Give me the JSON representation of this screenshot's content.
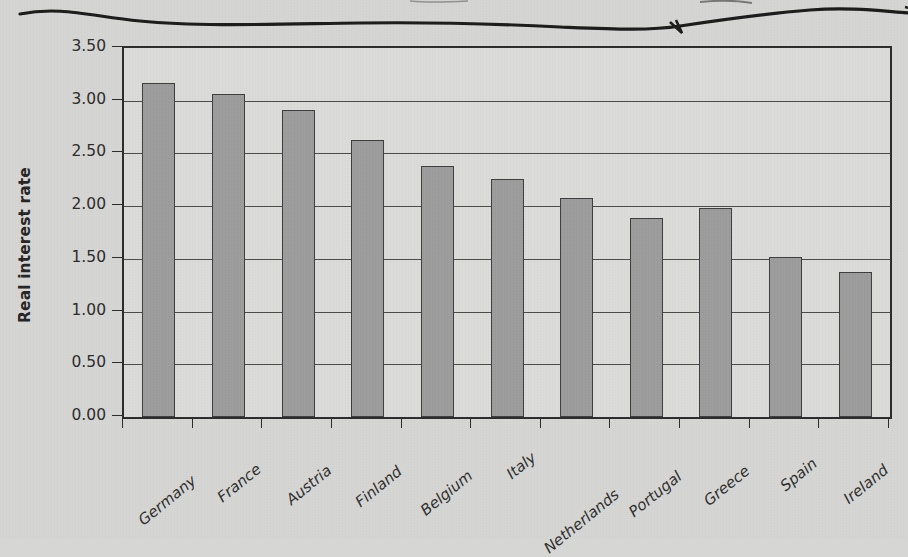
{
  "figure": {
    "annotation_note": "hand-drawn underline squiggle across top of scanned page (text above cropped off)"
  },
  "chart_data": {
    "type": "bar",
    "title": "",
    "subtitle": "",
    "xlabel": "",
    "ylabel": "Real interest rate",
    "ylim": [
      0.0,
      3.5
    ],
    "ytick_step": 0.5,
    "grid": true,
    "legend": "none",
    "orientation": "vertical",
    "bar_color": "#9c9c9c",
    "bar_edge_color": "#3d3d3d",
    "plot_background": "#dcdcda",
    "page_background": "#d6d6d4",
    "categories": [
      "Germany",
      "France",
      "Austria",
      "Finland",
      "Belgium",
      "Italy",
      "Netherlands",
      "Portugal",
      "Greece",
      "Spain",
      "Ireland"
    ],
    "values": [
      3.17,
      3.06,
      2.91,
      2.63,
      2.38,
      2.26,
      2.08,
      1.89,
      1.98,
      1.52,
      1.38
    ],
    "ytick_labels": [
      "0.00",
      "0.50",
      "1.00",
      "1.50",
      "2.00",
      "2.50",
      "3.00",
      "3.50"
    ],
    "ytick_values": [
      0.0,
      0.5,
      1.0,
      1.5,
      2.0,
      2.5,
      3.0,
      3.5
    ]
  }
}
